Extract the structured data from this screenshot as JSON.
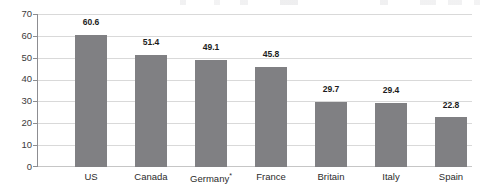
{
  "chart_data": {
    "type": "bar",
    "title": "",
    "xlabel": "",
    "ylabel": "",
    "categories": [
      "US",
      "Canada",
      "Germany*",
      "France",
      "Britain",
      "Italy",
      "Spain"
    ],
    "values": [
      60.6,
      51.4,
      49.1,
      45.8,
      29.7,
      29.4,
      22.8
    ],
    "value_labels": [
      "60.6",
      "51.4",
      "49.1",
      "45.8",
      "29.7",
      "29.4",
      "22.8"
    ],
    "ylim": [
      0,
      70
    ],
    "ytick_labels": [
      "0",
      "10",
      "20",
      "30",
      "40",
      "50",
      "60",
      "70"
    ],
    "yticks": [
      0,
      10,
      20,
      30,
      40,
      50,
      60,
      70
    ],
    "grid": true,
    "legend": null,
    "series": [
      {
        "name": "",
        "values": [
          60.6,
          51.4,
          49.1,
          45.8,
          29.7,
          29.4,
          22.8
        ]
      }
    ],
    "footnote_marker": "*",
    "colors": {
      "bar": "#808083",
      "gridline": "#d9d9d9",
      "axis": "#8d8d91",
      "label_text": "#2b2b2b",
      "value_text": "#1c1c1c",
      "background": "#ffffff"
    }
  }
}
